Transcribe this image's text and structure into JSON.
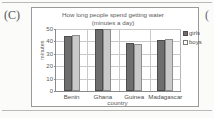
{
  "part_label": "(C)",
  "part_label_right": "(",
  "chart_data": {
    "type": "bar",
    "title": "How long people spend getting water",
    "subtitle": "(minutes a day)",
    "xlabel": "country",
    "ylabel": "minutes",
    "categories": [
      "Benin",
      "Ghana",
      "Guinea",
      "Madagascar"
    ],
    "series": [
      {
        "name": "girls",
        "values": [
          44,
          50,
          39,
          41
        ],
        "color": "#6e6e6e"
      },
      {
        "name": "boys",
        "values": [
          45,
          50,
          38,
          42
        ],
        "color": "#c9c9c9"
      }
    ],
    "ylim": [
      0,
      50
    ],
    "yticks": [
      0,
      10,
      20,
      30,
      40,
      50
    ],
    "ytick_labels": [
      "0",
      "10",
      "20",
      "30",
      "40",
      "50"
    ],
    "grid": true,
    "legend_position": "right",
    "legend": [
      "girls",
      "boys"
    ]
  }
}
